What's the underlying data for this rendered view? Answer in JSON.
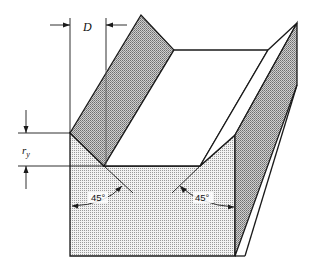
{
  "diagram": {
    "labels": {
      "width_dimension": "D",
      "radius_dimension_main": "r",
      "radius_dimension_sub": "y",
      "angle_left": "45°",
      "angle_right": "45°"
    },
    "colors": {
      "stroke": "#1a1a1a",
      "front_face": "#e6e6e6",
      "side_face": "#b8b8b8",
      "top_face": "#ffffff"
    }
  }
}
